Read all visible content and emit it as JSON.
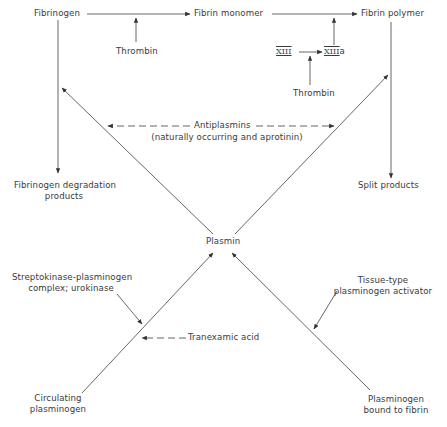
{
  "diagram": {
    "nodes": {
      "fibrinogen": "Fibrinogen",
      "fibrin_monomer": "Fibrin monomer",
      "fibrin_polymer": "Fibrin polymer",
      "thrombin_1": "Thrombin",
      "thrombin_2": "Thrombin",
      "factor_xiii": "XIII",
      "factor_xiiia_numeral": "XIII",
      "factor_xiiia_suffix": "a",
      "fdp_line1": "Fibrinogen degradation",
      "fdp_line2": "products",
      "split_products": "Split products",
      "plasmin": "Plasmin",
      "antiplasmins_line1": "Antiplasmins",
      "antiplasmins_line2": "(naturally occurring and aprotinin)",
      "streptokinase_line1": "Streptokinase-plasminogen",
      "streptokinase_line2": "complex; urokinase",
      "tranexamic_acid": "Tranexamic acid",
      "tpa_line1": "Tissue-type",
      "tpa_line2": "plasminogen activator",
      "circulating_line1": "Circulating",
      "circulating_line2": "plasminogen",
      "bound_line1": "Plasminogen",
      "bound_line2": "bound to fibrin"
    },
    "edges": [
      {
        "from": "Fibrinogen",
        "to": "Fibrin monomer",
        "style": "solid"
      },
      {
        "from": "Thrombin",
        "to": "Fibrinogen→Fibrin monomer",
        "style": "solid"
      },
      {
        "from": "Fibrin monomer",
        "to": "Fibrin polymer",
        "style": "solid"
      },
      {
        "from": "XIII",
        "to": "XIIIa",
        "style": "solid"
      },
      {
        "from": "Thrombin",
        "to": "XIII→XIIIa",
        "style": "solid"
      },
      {
        "from": "XIIIa",
        "to": "Fibrin monomer→Fibrin polymer",
        "style": "solid"
      },
      {
        "from": "Fibrinogen",
        "to": "Fibrinogen degradation products",
        "style": "solid"
      },
      {
        "from": "Fibrin polymer",
        "to": "Split products",
        "style": "solid"
      },
      {
        "from": "Plasmin",
        "to": "Fibrinogen line",
        "style": "solid"
      },
      {
        "from": "Plasmin",
        "to": "Fibrin polymer line",
        "style": "solid"
      },
      {
        "from": "Antiplasmins",
        "to": "Plasmin→Fibrinogen",
        "style": "dashed"
      },
      {
        "from": "Antiplasmins",
        "to": "Plasmin→Fibrin polymer",
        "style": "dashed"
      },
      {
        "from": "Circulating plasminogen",
        "to": "Plasmin",
        "style": "solid"
      },
      {
        "from": "Plasminogen bound to fibrin",
        "to": "Plasmin",
        "style": "solid"
      },
      {
        "from": "Streptokinase-plasminogen complex; urokinase",
        "to": "Circulating plasminogen→Plasmin",
        "style": "solid"
      },
      {
        "from": "Tranexamic acid",
        "to": "Circulating plasminogen→Plasmin",
        "style": "dashed"
      },
      {
        "from": "Tissue-type plasminogen activator",
        "to": "Plasminogen bound to fibrin→Plasmin",
        "style": "solid"
      }
    ],
    "colors": {
      "line": "#555555",
      "text": "#3a3a3a",
      "background": "#ffffff"
    }
  }
}
